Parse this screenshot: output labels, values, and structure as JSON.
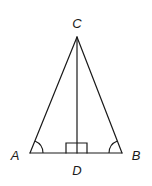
{
  "diagram": {
    "type": "geometry",
    "labels": {
      "A": "A",
      "B": "B",
      "C": "C",
      "D": "D"
    },
    "points": {
      "A": [
        30,
        153
      ],
      "B": [
        122,
        153
      ],
      "C": [
        77,
        37
      ],
      "D": [
        77,
        153
      ]
    },
    "segments": [
      {
        "name": "AC",
        "from": "A",
        "to": "C"
      },
      {
        "name": "BC",
        "from": "B",
        "to": "C"
      },
      {
        "name": "AB",
        "from": "A",
        "to": "B"
      },
      {
        "name": "CD",
        "from": "C",
        "to": "D"
      }
    ],
    "marks": {
      "right_angle_at": "D",
      "congruent_angles": [
        "A",
        "B"
      ]
    },
    "colors": {
      "stroke": "#1a1a1a",
      "background": "#ffffff"
    }
  }
}
